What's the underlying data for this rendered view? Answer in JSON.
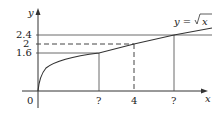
{
  "diagram": {
    "function_label": "y = √x",
    "function_label_prefix": "y = ",
    "function_label_radicand": "x",
    "axes": {
      "x_label": "x",
      "y_label": "y",
      "origin": "0"
    },
    "y_ticks": [
      "2.4",
      "2",
      "1.6"
    ],
    "x_ticks": [
      "?",
      "4",
      "?"
    ],
    "colors": {
      "line": "#333333",
      "background": "#ffffff"
    }
  }
}
